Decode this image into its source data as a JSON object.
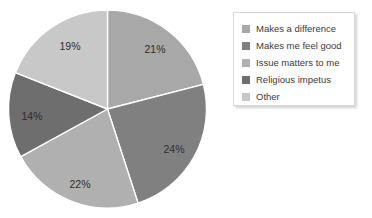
{
  "chart_data": {
    "type": "pie",
    "title": "",
    "subtitle": "",
    "xlabel": "",
    "ylabel": "",
    "grid": false,
    "legend_position": "right",
    "start_angle_deg": 0,
    "direction": "clockwise",
    "categories": [
      "Makes a difference",
      "Makes me feel good",
      "Issue matters to me",
      "Religious impetus",
      "Other"
    ],
    "values": [
      21,
      24,
      22,
      14,
      19
    ],
    "value_unit": "%",
    "data_labels": [
      "21%",
      "24%",
      "22%",
      "14%",
      "19%"
    ],
    "colors": [
      "#a8a8a8",
      "#808080",
      "#b0b0b0",
      "#6e6e6e",
      "#c8c8c8"
    ],
    "slices": [
      {
        "label": "Makes a difference",
        "value": 21,
        "data_label": "21%",
        "color": "#a8a8a8",
        "label_x": 155,
        "label_y": 50,
        "label_tone": "dark"
      },
      {
        "label": "Makes me feel good",
        "value": 24,
        "data_label": "24%",
        "color": "#808080",
        "label_x": 174,
        "label_y": 150,
        "label_tone": "dark"
      },
      {
        "label": "Issue matters to me",
        "value": 22,
        "data_label": "22%",
        "color": "#b0b0b0",
        "label_x": 80,
        "label_y": 185,
        "label_tone": "dark"
      },
      {
        "label": "Religious impetus",
        "value": 14,
        "data_label": "14%",
        "color": "#6e6e6e",
        "label_x": 32,
        "label_y": 117,
        "label_tone": "dark"
      },
      {
        "label": "Other",
        "value": 19,
        "data_label": "19%",
        "color": "#c8c8c8",
        "label_x": 70,
        "label_y": 47,
        "label_tone": "dark"
      }
    ],
    "geometry": {
      "cx": 107.5,
      "cy": 109,
      "r": 99
    }
  },
  "legend": {
    "items": [
      {
        "label": "Makes a difference",
        "color": "#a8a8a8"
      },
      {
        "label": "Makes me feel good",
        "color": "#808080"
      },
      {
        "label": "Issue matters to me",
        "color": "#b0b0b0"
      },
      {
        "label": "Religious impetus",
        "color": "#6e6e6e"
      },
      {
        "label": "Other",
        "color": "#c8c8c8"
      }
    ]
  }
}
